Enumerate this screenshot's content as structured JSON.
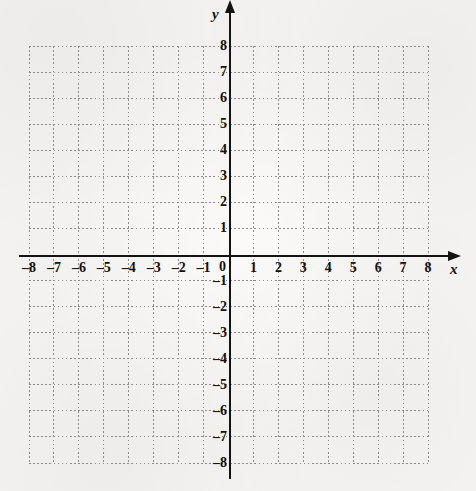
{
  "figure": {
    "kind": "blank-cartesian-coordinate-grid",
    "background_color": "#f5f4f2",
    "axis_color": "#131313",
    "grid_color": "#8b8b8b",
    "label_color": "#101010"
  },
  "chart_data": {
    "type": "scatter",
    "title": "",
    "subtitle": "",
    "xlabel": "x",
    "ylabel": "y",
    "xlim": [
      -8,
      8
    ],
    "ylim": [
      -8,
      8
    ],
    "x_ticks": [
      -8,
      -7,
      -6,
      -5,
      -4,
      -3,
      -2,
      -1,
      0,
      1,
      2,
      3,
      4,
      5,
      6,
      7,
      8
    ],
    "y_ticks": [
      -8,
      -7,
      -6,
      -5,
      -4,
      -3,
      -2,
      -1,
      0,
      1,
      2,
      3,
      4,
      5,
      6,
      7,
      8
    ],
    "x_tick_labels": [
      "–8",
      "–7",
      "–6",
      "–5",
      "–4",
      "–3",
      "–2",
      "–1",
      "0",
      "1",
      "2",
      "3",
      "4",
      "5",
      "6",
      "7",
      "8"
    ],
    "y_tick_labels": [
      "–8",
      "–7",
      "–6",
      "–5",
      "–4",
      "–3",
      "–2",
      "–1",
      "0",
      "1",
      "2",
      "3",
      "4",
      "5",
      "6",
      "7",
      "8"
    ],
    "origin_label": "0",
    "grid": true,
    "grid_style": "dotted",
    "grid_step": 1,
    "legend": null,
    "legend_position": "none",
    "annotations": [],
    "series": [],
    "values": [],
    "x": [],
    "categories": []
  },
  "axes": {
    "x_axis_label": "x",
    "y_axis_label": "y",
    "x_arrow": "arrow-right-icon",
    "y_arrow": "arrow-up-icon"
  }
}
